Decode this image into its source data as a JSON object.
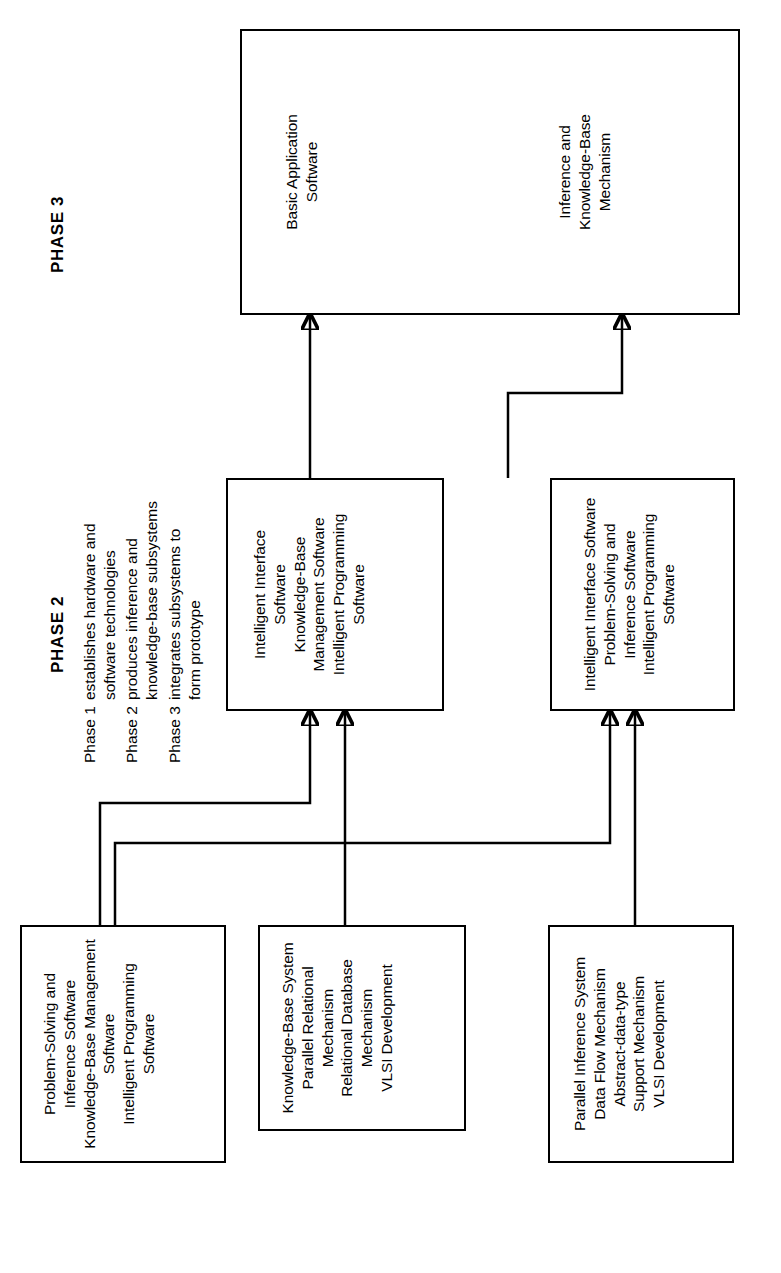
{
  "figure": {
    "orientation": "rotated-90",
    "background_color": "#ffffff",
    "line_color": "#000000"
  },
  "phases": [
    {
      "id": "phase1",
      "label": "PHASE 1"
    },
    {
      "id": "phase2",
      "label": "PHASE 2"
    },
    {
      "id": "phase3",
      "label": "PHASE 3"
    }
  ],
  "nodes": {
    "p1_box1": {
      "text": "Parallel Inference System\nData Flow Mechanism\nAbstract-data-type\nSupport Mechanism\nVLSI Development"
    },
    "p1_box2": {
      "text": "Knowledge-Base System\nParallel Relational\nMechanism\nRelational Database\nMechanism\nVLSI Development"
    },
    "p1_box3": {
      "text": "Problem-Solving and\nInference Software\nKnowledge-Base Management\nSoftware\nIntelligent Programming\nSoftware"
    },
    "p2_box1": {
      "text": "Intelligent Interface Software\nProblem-Solving and\nInference Software\nIntelligent Programming\nSoftware"
    },
    "p2_box2": {
      "text": "Intelligent Interface\nSoftware\nKnowledge-Base\nManagement Software\nIntelligent Programming\nSoftware"
    },
    "p3_box": {
      "group1": "Inference and\nKnowledge-Base\nMechanism",
      "group2": "Basic Application\nSoftware"
    }
  },
  "notes": [
    {
      "key": "Phase 1",
      "text": "establishes hardware and\nsoftware technologies"
    },
    {
      "key": "Phase 2",
      "text": "produces inference and\nknowledge-base subsystems"
    },
    {
      "key": "Phase 3",
      "text": "integrates subsystems to\nform prototype"
    }
  ]
}
